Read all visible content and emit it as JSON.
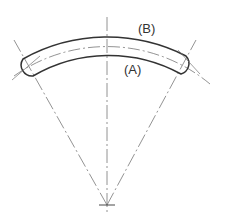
{
  "diagram": {
    "labels": {
      "outer": "(B)",
      "inner": "(A)"
    },
    "colors": {
      "stroke": "#333333",
      "construction": "#777777",
      "background": "#ffffff"
    }
  }
}
